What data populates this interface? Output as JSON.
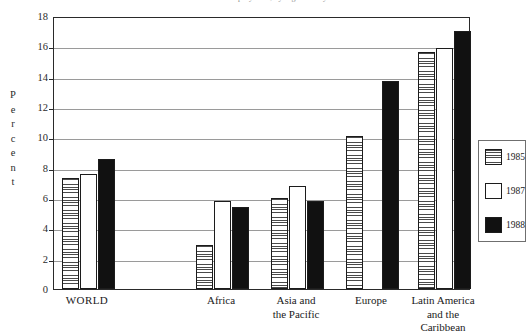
{
  "chart_data": {
    "type": "bar",
    "title": "Chart: Unemployment, by region and year",
    "xlabel": "",
    "ylabel": "Percent",
    "ylim": [
      0,
      18
    ],
    "ytick_step": 2,
    "yticks": [
      18,
      16,
      14,
      12,
      10,
      8,
      6,
      4,
      2,
      0
    ],
    "grid": true,
    "legend_position": "right-outside",
    "categories": [
      "WORLD",
      "Africa",
      "Asia and the Pacific",
      "Europe",
      "Latin America and the Caribbean"
    ],
    "series": [
      {
        "name": "1985",
        "fill": "hatched",
        "values": [
          7.3,
          2.9,
          6.0,
          10.1,
          15.6
        ]
      },
      {
        "name": "1987",
        "fill": "open",
        "values": [
          7.6,
          5.8,
          6.8,
          null,
          15.9
        ]
      },
      {
        "name": "1988",
        "fill": "solid",
        "values": [
          8.6,
          5.4,
          5.8,
          13.7,
          17.0
        ]
      }
    ]
  },
  "axis": {
    "y_title_letters": [
      "P",
      "e",
      "r",
      "c",
      "e",
      "n",
      "t"
    ],
    "y_tick_labels": [
      "18",
      "16",
      "14",
      "12",
      "10",
      "8",
      "6",
      "4",
      "2",
      "0"
    ]
  },
  "categories_display": [
    {
      "lines": [
        "WORLD"
      ]
    },
    {
      "lines": [
        "Africa"
      ]
    },
    {
      "lines": [
        "Asia and",
        "the Pacific"
      ]
    },
    {
      "lines": [
        "Europe"
      ]
    },
    {
      "lines": [
        "Latin America",
        "and the",
        "Caribbean"
      ]
    }
  ],
  "legend": {
    "items": [
      {
        "label": "1985",
        "fill": "hatched"
      },
      {
        "label": "1987",
        "fill": "open"
      },
      {
        "label": "1988",
        "fill": "solid"
      }
    ]
  },
  "colors": {
    "solid_bar": "#111111",
    "bar_outline": "#1c1c1c",
    "gridline": "#9a9a9a",
    "frame": "#2a2a2a",
    "text": "#1a1a1a"
  }
}
